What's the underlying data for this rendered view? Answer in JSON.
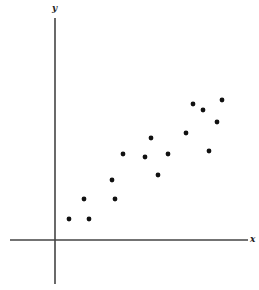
{
  "chart_data": {
    "type": "scatter",
    "title": "",
    "xlabel": "x",
    "ylabel": "y",
    "grid": false,
    "legend": null,
    "axis_color": "#444444",
    "point_color": "#111111",
    "points_px": [
      {
        "x": 69,
        "y": 219
      },
      {
        "x": 89,
        "y": 219
      },
      {
        "x": 84,
        "y": 199
      },
      {
        "x": 115,
        "y": 199
      },
      {
        "x": 112,
        "y": 180
      },
      {
        "x": 123,
        "y": 154
      },
      {
        "x": 145,
        "y": 157
      },
      {
        "x": 151,
        "y": 138
      },
      {
        "x": 158,
        "y": 175
      },
      {
        "x": 168,
        "y": 154
      },
      {
        "x": 186,
        "y": 133
      },
      {
        "x": 193,
        "y": 104
      },
      {
        "x": 203,
        "y": 110
      },
      {
        "x": 209,
        "y": 151
      },
      {
        "x": 217,
        "y": 122
      },
      {
        "x": 222,
        "y": 100
      }
    ],
    "values": [
      {
        "x": 1.4,
        "y": 2.1
      },
      {
        "x": 3.4,
        "y": 2.1
      },
      {
        "x": 2.9,
        "y": 4.1
      },
      {
        "x": 6.0,
        "y": 4.1
      },
      {
        "x": 5.7,
        "y": 6.0
      },
      {
        "x": 6.8,
        "y": 8.6
      },
      {
        "x": 9.0,
        "y": 8.3
      },
      {
        "x": 9.6,
        "y": 10.2
      },
      {
        "x": 10.3,
        "y": 6.5
      },
      {
        "x": 11.3,
        "y": 8.6
      },
      {
        "x": 13.1,
        "y": 10.7
      },
      {
        "x": 13.8,
        "y": 13.6
      },
      {
        "x": 14.8,
        "y": 13.0
      },
      {
        "x": 15.4,
        "y": 8.9
      },
      {
        "x": 16.2,
        "y": 11.8
      },
      {
        "x": 16.7,
        "y": 14.0
      }
    ],
    "note": "No tick marks or numeric tick labels are shown; values are in arbitrary units (1 unit = 10px) measured from the axis origin."
  },
  "labels": {
    "x_axis": "x",
    "y_axis": "y"
  }
}
